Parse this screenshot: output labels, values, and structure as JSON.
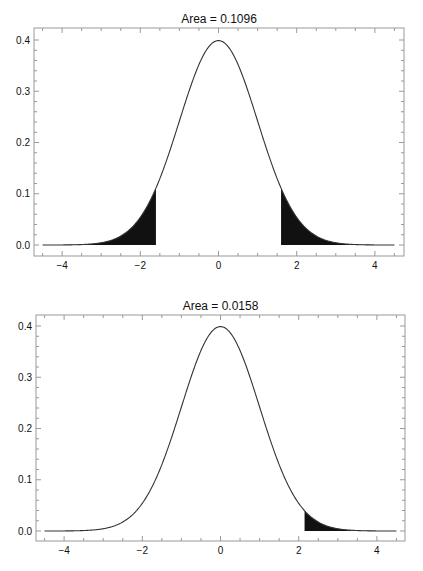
{
  "chart_data": [
    {
      "type": "area",
      "title": "Area = 0.1096",
      "xlabel": "",
      "ylabel": "",
      "curve": "standard normal density, mean 0, sd 1",
      "xlim": [
        -4.6,
        4.6
      ],
      "ylim": [
        -0.02,
        0.42
      ],
      "x_ticks": [
        -4,
        -2,
        0,
        2,
        4
      ],
      "x_tick_labels": [
        "-4",
        "-2",
        "0",
        "2",
        "4"
      ],
      "y_ticks": [
        0.0,
        0.1,
        0.2,
        0.3,
        0.4
      ],
      "y_tick_labels": [
        "0.0",
        "0.1",
        "0.2",
        "0.3",
        "0.4"
      ],
      "shaded_regions": [
        {
          "from": -4.5,
          "to": -1.6
        },
        {
          "from": 1.6,
          "to": 4.5
        }
      ],
      "shaded_area": 0.1096,
      "grid": false,
      "legend": null
    },
    {
      "type": "area",
      "title": "Area = 0.0158",
      "xlabel": "",
      "ylabel": "",
      "curve": "standard normal density, mean 0, sd 1",
      "xlim": [
        -4.6,
        4.6
      ],
      "ylim": [
        -0.02,
        0.42
      ],
      "x_ticks": [
        -4,
        -2,
        0,
        2,
        4
      ],
      "x_tick_labels": [
        "-4",
        "-2",
        "0",
        "2",
        "4"
      ],
      "y_ticks": [
        0.0,
        0.1,
        0.2,
        0.3,
        0.4
      ],
      "y_tick_labels": [
        "0.0",
        "0.1",
        "0.2",
        "0.3",
        "0.4"
      ],
      "shaded_regions": [
        {
          "from": 2.15,
          "to": 4.5
        }
      ],
      "shaded_area": 0.0158,
      "grid": false,
      "legend": null
    }
  ],
  "colors": {
    "curve": "#333333",
    "fill": "#111111",
    "frame": "#999999",
    "text": "#111111"
  }
}
